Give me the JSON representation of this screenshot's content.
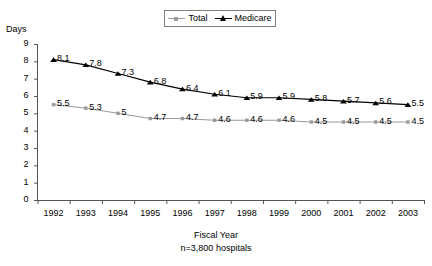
{
  "chart_data": {
    "type": "line",
    "title": "",
    "xlabel": "Fiscal Year",
    "ylabel": "Days",
    "subcaption": "n=3,800 hospitals",
    "grid": false,
    "legend_position": "top-center",
    "ylim": [
      0,
      9
    ],
    "ytick_labels": [
      "9",
      "8",
      "7",
      "6",
      "5",
      "4",
      "3",
      "2",
      "1",
      "0"
    ],
    "categories": [
      "1992",
      "1993",
      "1994",
      "1995",
      "1996",
      "1997",
      "1998",
      "1999",
      "2000",
      "2001",
      "2002",
      "2003"
    ],
    "series": [
      {
        "name": "Total",
        "color": "#999999",
        "marker": "square",
        "values": [
          5.5,
          5.3,
          5.0,
          4.7,
          4.7,
          4.6,
          4.6,
          4.6,
          4.5,
          4.5,
          4.5,
          4.5
        ],
        "labels": [
          "5.5",
          "5.3",
          "5",
          "4.7",
          "4.7",
          "4.6",
          "4.6",
          "4.6",
          "4.5",
          "4.5",
          "4.5",
          "4.5"
        ]
      },
      {
        "name": "Medicare",
        "color": "#000000",
        "marker": "triangle",
        "values": [
          8.1,
          7.8,
          7.3,
          6.8,
          6.4,
          6.1,
          5.9,
          5.9,
          5.8,
          5.7,
          5.6,
          5.5
        ],
        "labels": [
          "8.1",
          "7.8",
          "7.3",
          "6.8",
          "6.4",
          "6.1",
          "5.9",
          "5.9",
          "5.8",
          "5.7",
          "5.6",
          "5.5"
        ]
      }
    ]
  },
  "legend": {
    "total_label": "Total",
    "medicare_label": "Medicare"
  },
  "axes": {
    "y_title": "Days",
    "x_title": "Fiscal Year",
    "note": "n=3,800 hospitals"
  }
}
